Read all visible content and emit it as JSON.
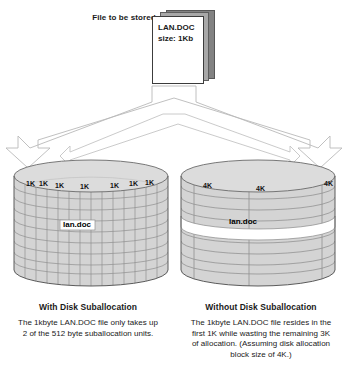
{
  "diagram": {
    "title_hidden": "Disk Suballocation comparison",
    "source_file": {
      "label_line1": "File to be",
      "label_line2": "stored",
      "doc_name": "LAN.DOC",
      "doc_size": "size: 1Kb"
    },
    "arrow": {
      "name": "split-arrow",
      "direction": "down-split"
    },
    "left_disk": {
      "name": "disk-with-suballocation",
      "block_labels": [
        "1K",
        "1K",
        "1K",
        "1K",
        "1K",
        "1K",
        "1K"
      ],
      "file_label": "lan.doc",
      "grid_columns": 14,
      "grid_rows": 9
    },
    "right_disk": {
      "name": "disk-without-suballocation",
      "block_labels": [
        "4K",
        "4K",
        "4K"
      ],
      "file_label": "lan.doc",
      "grid_columns": 3,
      "grid_rows": 9
    },
    "captions": {
      "left": {
        "title": "With Disk Suballocation",
        "lines": [
          "The 1kbyte LAN.DOC file only takes up",
          "2 of the 512 byte suballocation units."
        ]
      },
      "right": {
        "title": "Without Disk Suballocation",
        "lines": [
          "The 1kbyte LAN.DOC file resides in the",
          "first 1K while wasting the remaining 3K",
          "of allocation.  (Assuming disk allocation",
          "block size of 4K.)"
        ]
      }
    },
    "footer_note": ""
  },
  "colors": {
    "cylinder_fill": "#d4d4d4",
    "cylinder_top": "#dcdcdc",
    "grid_line": "#8a8a8a",
    "outline": "#555555",
    "highlight_fill": "#ffffff",
    "doc_front": "#ffffff",
    "doc_mid": "#a8a8a8",
    "doc_back": "#828282",
    "text": "#1a1a1a"
  }
}
